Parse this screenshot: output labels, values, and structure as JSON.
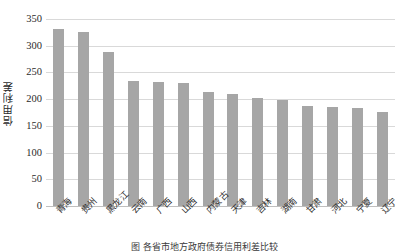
{
  "chart_data": {
    "type": "bar",
    "title": "",
    "xlabel": "",
    "ylabel": "信用利差",
    "ylim": [
      0,
      350
    ],
    "yticks": [
      0,
      50,
      100,
      150,
      200,
      250,
      300,
      350
    ],
    "grid": true,
    "legend": false,
    "bar_color": "#a6a6a6",
    "gridline_color": "#d9d9d9",
    "categories": [
      "青海",
      "贵州",
      "黑龙江",
      "云南",
      "广西",
      "山西",
      "内蒙古",
      "天津",
      "吉林",
      "湖南",
      "甘肃",
      "河北",
      "宁夏",
      "辽宁"
    ],
    "values": [
      331,
      325,
      288,
      234,
      233,
      231,
      213,
      210,
      203,
      199,
      188,
      186,
      184,
      175
    ],
    "series": [
      {
        "name": "信用利差",
        "values": [
          331,
          325,
          288,
          234,
          233,
          231,
          213,
          210,
          203,
          199,
          188,
          186,
          184,
          175
        ]
      }
    ]
  },
  "caption": {
    "text": "图       各省市地方政府债券信用利差比较"
  }
}
